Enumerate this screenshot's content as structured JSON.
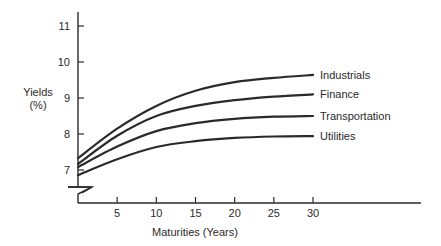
{
  "chart_data": {
    "type": "line",
    "title": "",
    "xlabel": "Maturities (Years)",
    "ylabel": "Yields (%)",
    "ylabel_lines": [
      "Yields",
      "(%)"
    ],
    "x_ticks": [
      5,
      10,
      15,
      20,
      25,
      30
    ],
    "y_ticks": [
      7,
      8,
      9,
      10,
      11
    ],
    "xlim": [
      0,
      30
    ],
    "ylim": [
      6.5,
      11.5
    ],
    "y_axis_break": true,
    "grid": false,
    "legend_position": "inline-right",
    "x": [
      0,
      5,
      10,
      15,
      20,
      25,
      30
    ],
    "series": [
      {
        "name": "Industrials",
        "values": [
          7.33,
          8.15,
          8.78,
          9.2,
          9.44,
          9.56,
          9.64
        ]
      },
      {
        "name": "Finance",
        "values": [
          7.17,
          7.95,
          8.5,
          8.78,
          8.94,
          9.04,
          9.1
        ]
      },
      {
        "name": "Transportation",
        "values": [
          7.08,
          7.65,
          8.08,
          8.3,
          8.42,
          8.48,
          8.5
        ]
      },
      {
        "name": "Utilities",
        "values": [
          6.86,
          7.3,
          7.64,
          7.8,
          7.89,
          7.93,
          7.94
        ]
      }
    ]
  }
}
